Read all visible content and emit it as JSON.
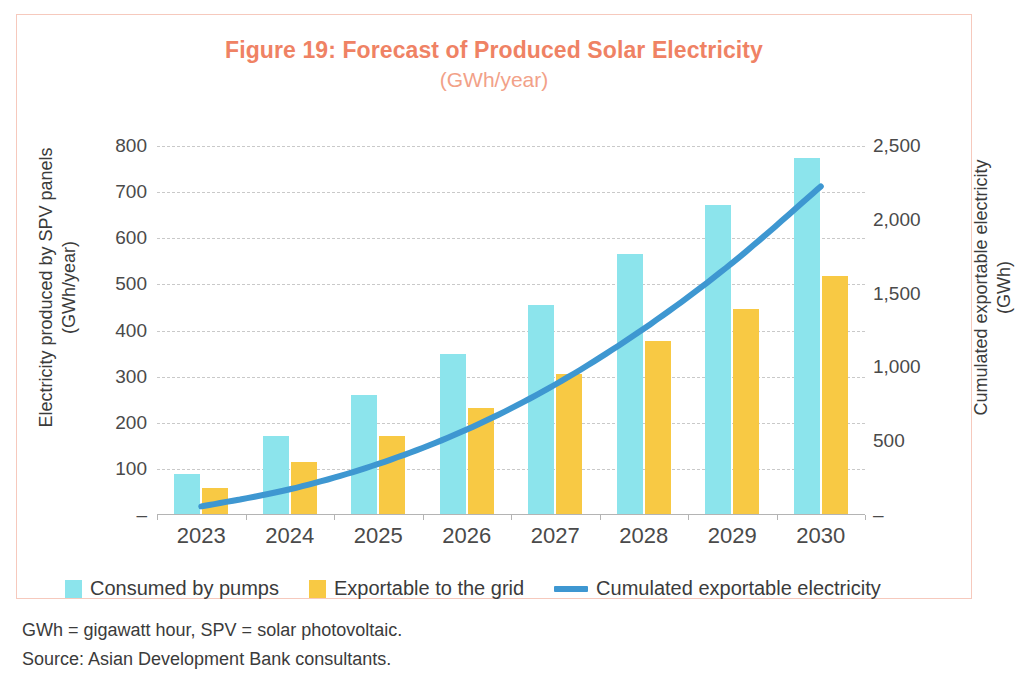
{
  "figure": {
    "title": "Figure 19: Forecast of Produced Solar Electricity",
    "subtitle": "(GWh/year)",
    "title_color": "#ef8264",
    "subtitle_color": "#f2a188",
    "frame_color": "#f6c9bd"
  },
  "notes": {
    "abbreviations": "GWh = gigawatt hour, SPV = solar photovoltaic.",
    "source": "Source: Asian Development Bank consultants."
  },
  "legend": {
    "items": [
      {
        "label": "Consumed by pumps",
        "color": "#8ce4ec",
        "marker": "square"
      },
      {
        "label": "Exportable to the grid",
        "color": "#f8c944",
        "marker": "square"
      },
      {
        "label": "Cumulated exportable electricity",
        "color": "#3e97d1",
        "marker": "line"
      }
    ]
  },
  "chart_data": {
    "type": "bar",
    "title": "Figure 19: Forecast of Produced Solar Electricity",
    "subtitle": "(GWh/year)",
    "categories": [
      "2023",
      "2024",
      "2025",
      "2026",
      "2027",
      "2028",
      "2029",
      "2030"
    ],
    "xlabel": "",
    "ylabel": "Electricity produced by SPV panels\n(GWh/year)",
    "y2label": "Cumulated exportable electricity\n(GWh)",
    "ylim": [
      0,
      800
    ],
    "y2lim": [
      0,
      2500
    ],
    "yticks": [
      0,
      100,
      200,
      300,
      400,
      500,
      600,
      700,
      800
    ],
    "ytick_labels": [
      "–",
      "100",
      "200",
      "300",
      "400",
      "500",
      "600",
      "700",
      "800"
    ],
    "y2ticks": [
      0,
      500,
      1000,
      1500,
      2000,
      2500
    ],
    "y2tick_labels": [
      "–",
      "500",
      "1,000",
      "1,500",
      "2,000",
      "2,500"
    ],
    "grid": true,
    "legend_position": "bottom",
    "series": [
      {
        "name": "Consumed by pumps",
        "type": "bar",
        "axis": "left",
        "color": "#8ce4ec",
        "values": [
          88,
          172,
          261,
          349,
          456,
          566,
          672,
          775
        ]
      },
      {
        "name": "Exportable to the grid",
        "type": "bar",
        "axis": "left",
        "color": "#f8c944",
        "values": [
          58,
          116,
          172,
          233,
          305,
          378,
          446,
          518
        ]
      },
      {
        "name": "Cumulated exportable electricity",
        "type": "line",
        "axis": "right",
        "color": "#3e97d1",
        "values": [
          58,
          174,
          346,
          579,
          884,
          1262,
          1708,
          2226
        ]
      }
    ]
  }
}
